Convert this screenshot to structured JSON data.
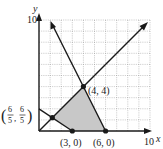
{
  "figure": {
    "type": "linear-programming-feasible-region",
    "axes": {
      "x_label": "x",
      "y_label": "y",
      "x_max_label": "10",
      "y_max_label": "10",
      "xlim": [
        0,
        10
      ],
      "ylim": [
        0,
        10
      ],
      "grid": true,
      "grid_step": 1
    },
    "lines": [
      {
        "name": "y = x",
        "from": [
          0,
          0
        ],
        "to": [
          9.6,
          9.6
        ],
        "arrow": true
      },
      {
        "name": "2x + y = 12",
        "from": [
          6,
          0
        ],
        "to": [
          1.0,
          10
        ],
        "arrow": true
      },
      {
        "name": "2x + 3y = 6",
        "from": [
          0,
          2
        ],
        "to": [
          3,
          0
        ],
        "arrow": false
      }
    ],
    "feasible_region": {
      "vertices": [
        [
          1.2,
          1.2
        ],
        [
          3,
          0
        ],
        [
          6,
          0
        ],
        [
          4,
          4
        ]
      ],
      "fill": "#c8c8c8"
    },
    "points": [
      {
        "label": "(4, 4)",
        "x": 4,
        "y": 4
      },
      {
        "label": "(3, 0)",
        "x": 3,
        "y": 0
      },
      {
        "label": "(6, 0)",
        "x": 6,
        "y": 0
      },
      {
        "label_num": "6",
        "label_den": "5",
        "x": 1.2,
        "y": 1.2
      }
    ],
    "colors": {
      "line": "#1a1a1a",
      "grid": "#9a9a9a",
      "shade": "#c8c8c8"
    }
  }
}
